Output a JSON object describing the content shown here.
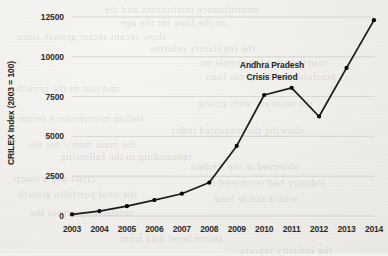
{
  "chart_data": {
    "type": "line",
    "title": "",
    "subtitle": "",
    "xlabel": "",
    "ylabel": "CRILEX Index (2003 = 100)",
    "categories": [
      "2003",
      "2004",
      "2005",
      "2006",
      "2007",
      "2008",
      "2009",
      "2010",
      "2011",
      "2012",
      "2013",
      "2014"
    ],
    "x": [
      2003,
      2004,
      2005,
      2006,
      2007,
      2008,
      2009,
      2010,
      2011,
      2012,
      2013,
      2014
    ],
    "values": [
      100,
      310,
      620,
      1000,
      1400,
      2100,
      4400,
      7600,
      8050,
      6250,
      9300,
      12300
    ],
    "series": [
      {
        "name": "CRILEX Index",
        "values": [
          100,
          310,
          620,
          1000,
          1400,
          2100,
          4400,
          7600,
          8050,
          6250,
          9300,
          12300
        ]
      }
    ],
    "yticks": [
      0,
      2500,
      5000,
      7500,
      10000,
      12500
    ],
    "ytick_labels": [
      "0",
      "2500",
      "5000",
      "7500",
      "10000",
      "12500"
    ],
    "ylim": [
      0,
      12500
    ],
    "xlim": [
      2003,
      2014
    ],
    "grid": "horizontal",
    "legend": "none",
    "marker": "circle",
    "line_color": "#1a1a1a",
    "marker_color": "#000000",
    "grid_color": "#cfcec9",
    "annotations": [
      {
        "name": "andhra-pradesh-crisis",
        "line1": "Andhra Pradesh",
        "line2": "Crisis Period"
      }
    ]
  },
  "bleed_text": [
    {
      "text": "microfinance institutions and the",
      "x": 104,
      "y": 3
    },
    {
      "text": "of the flow for the age",
      "x": 120,
      "y": 16
    },
    {
      "text": "show recent sector growth since",
      "x": 16,
      "y": 30
    },
    {
      "text": "the regulatory reforms",
      "x": 150,
      "y": 42
    },
    {
      "text": "distribution of the crisis on",
      "x": 200,
      "y": 56
    },
    {
      "text": "portfolio and the gross loan",
      "x": 206,
      "y": 70
    },
    {
      "text": "and that in the growth",
      "x": 16,
      "y": 82
    },
    {
      "text": "the recovery with strong",
      "x": 198,
      "y": 97
    },
    {
      "text": "Indian microfinance sector",
      "x": 18,
      "y": 112
    },
    {
      "text": "showing the measured index",
      "x": 170,
      "y": 124
    },
    {
      "text": "the main metric for the",
      "x": 28,
      "y": 138
    },
    {
      "text": "rebounding in the following",
      "x": 60,
      "y": 150
    },
    {
      "text": "observed in the Andhra",
      "x": 190,
      "y": 160
    },
    {
      "text": "crisis and a sharp",
      "x": 14,
      "y": 172
    },
    {
      "text": "industry had recovered to",
      "x": 206,
      "y": 176
    },
    {
      "text": "the total portfolio growth",
      "x": 18,
      "y": 188
    },
    {
      "text": "with a stable base",
      "x": 214,
      "y": 192
    },
    {
      "text": "outstanding across the",
      "x": 30,
      "y": 206
    },
    {
      "text": "sector level data from",
      "x": 120,
      "y": 232
    },
    {
      "text": "the industry reports",
      "x": 240,
      "y": 244
    }
  ]
}
